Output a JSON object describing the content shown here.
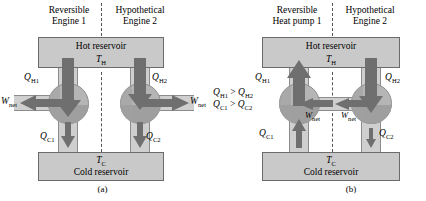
{
  "figure": {
    "caption_a": "(a)",
    "caption_b": "(b)",
    "inequalities": [
      "Q",
      "H1",
      " > ",
      "Q",
      "H2"
    ]
  },
  "panel_a": {
    "headers": {
      "left_line1": "Reversible",
      "left_line2": "Engine 1",
      "right_line1": "Hypothetical",
      "right_line2": "Engine 2"
    },
    "hot_reservoir": {
      "label": "Hot reservoir",
      "temperature_symbol": "T",
      "temperature_sub": "H"
    },
    "cold_reservoir": {
      "label": "Cold reservoir",
      "temperature_symbol": "T",
      "temperature_sub": "C"
    },
    "engine1": {
      "q_hot_symbol": "Q",
      "q_hot_sub": "H1",
      "q_cold_symbol": "Q",
      "q_cold_sub": "C1",
      "work_symbol": "W",
      "work_sub": "net",
      "q_hot_direction": "down",
      "q_cold_direction": "down",
      "work_direction": "left"
    },
    "engine2": {
      "q_hot_symbol": "Q",
      "q_hot_sub": "H2",
      "q_cold_symbol": "Q",
      "q_cold_sub": "C2",
      "work_symbol": "W",
      "work_sub": "net",
      "q_hot_direction": "down",
      "q_cold_direction": "down",
      "work_direction": "right"
    },
    "caption": "(a)"
  },
  "panel_b": {
    "headers": {
      "left_line1": "Reversible",
      "left_line2": "Heat pump 1",
      "right_line1": "Hypothetical",
      "right_line2": "Engine 2"
    },
    "hot_reservoir": {
      "label": "Hot reservoir",
      "temperature_symbol": "T",
      "temperature_sub": "H"
    },
    "cold_reservoir": {
      "label": "Cold reservoir",
      "temperature_symbol": "T",
      "temperature_sub": "C"
    },
    "heatpump1": {
      "q_hot_symbol": "Q",
      "q_hot_sub": "H1",
      "q_cold_symbol": "Q",
      "q_cold_sub": "C1",
      "work_symbol": "W",
      "work_sub": "net",
      "q_hot_direction": "up",
      "q_cold_direction": "up",
      "work_direction": "left"
    },
    "engine2": {
      "q_hot_symbol": "Q",
      "q_hot_sub": "H2",
      "q_cold_symbol": "Q",
      "q_cold_sub": "C2",
      "work_symbol": "W",
      "work_sub": "net",
      "q_hot_direction": "down",
      "q_cold_direction": "down",
      "work_direction": "left"
    },
    "relations": {
      "line1_lhs_symbol": "Q",
      "line1_lhs_sub": "H1",
      "line1_op": ">",
      "line1_rhs_symbol": "Q",
      "line1_rhs_sub": "H2",
      "line2_lhs_symbol": "Q",
      "line2_lhs_sub": "C1",
      "line2_op": ">",
      "line2_rhs_symbol": "Q",
      "line2_rhs_sub": "C2"
    },
    "caption": "(b)"
  },
  "colors": {
    "reservoir_fill": "#c9c9c9",
    "reservoir_stroke": "#6b6b6b",
    "circle_fill": "#b5b5b5",
    "circle_shade": "#9a9a9a",
    "band_fill": "#cfcfcf",
    "arrow_fill": "#6f6f6f",
    "divider": "#555555"
  }
}
